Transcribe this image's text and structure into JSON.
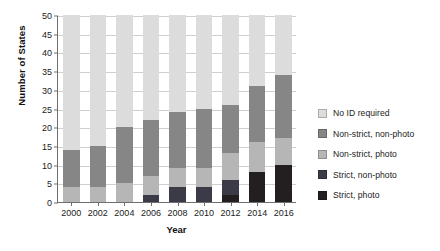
{
  "chart_data": {
    "type": "bar",
    "subtype": "stacked",
    "title": "",
    "xlabel": "Year",
    "ylabel": "Number of States",
    "categories": [
      "2000",
      "2002",
      "2004",
      "2006",
      "2008",
      "2010",
      "2012",
      "2014",
      "2016"
    ],
    "ylim": [
      0,
      50
    ],
    "yticks": [
      0,
      5,
      10,
      15,
      20,
      25,
      30,
      35,
      40,
      45,
      50
    ],
    "grid": true,
    "legend_position": "right",
    "series": [
      {
        "name": "Strict, photo",
        "color": "#231f20",
        "values": [
          0,
          0,
          0,
          0,
          0,
          0,
          2,
          8,
          10
        ]
      },
      {
        "name": "Strict, non-photo",
        "color": "#3b3b47",
        "values": [
          0,
          0,
          0,
          2,
          4,
          4,
          4,
          0,
          0
        ]
      },
      {
        "name": "Non-strict, photo",
        "color": "#b6b6b6",
        "values": [
          4,
          4,
          5,
          5,
          5,
          5,
          7,
          8,
          7
        ]
      },
      {
        "name": "Non-strict, non-photo",
        "color": "#868686",
        "values": [
          10,
          11,
          15,
          15,
          15,
          16,
          13,
          15,
          17
        ]
      },
      {
        "name": "No ID required",
        "color": "#dcdcdc",
        "values": [
          36,
          35,
          30,
          28,
          26,
          25,
          24,
          19,
          16
        ]
      }
    ],
    "totals": [
      50,
      50,
      50,
      50,
      50,
      50,
      50,
      50,
      50
    ]
  },
  "legend": {
    "items": [
      {
        "label": "No ID required",
        "color": "#dcdcdc"
      },
      {
        "label": "Non-strict, non-photo",
        "color": "#868686"
      },
      {
        "label": "Non-strict, photo",
        "color": "#b6b6b6"
      },
      {
        "label": "Strict, non-photo",
        "color": "#3b3b47"
      },
      {
        "label": "Strict, photo",
        "color": "#231f20"
      }
    ]
  },
  "axes": {
    "y_title": "Number of States",
    "x_title": "Year",
    "y_tick_labels": [
      "0",
      "5",
      "10",
      "15",
      "20",
      "25",
      "30",
      "35",
      "40",
      "45",
      "50"
    ],
    "x_tick_labels": [
      "2000",
      "2002",
      "2004",
      "2006",
      "2008",
      "2010",
      "2012",
      "2014",
      "2016"
    ]
  }
}
